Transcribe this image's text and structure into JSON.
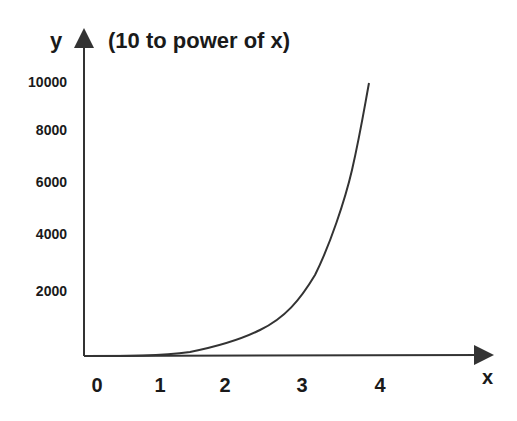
{
  "chart_data": {
    "type": "line",
    "title": "(10 to power of x)",
    "xlabel": "x",
    "ylabel": "y",
    "x_ticks": [
      "0",
      "1",
      "2",
      "3",
      "4"
    ],
    "y_ticks": [
      "2000",
      "4000",
      "6000",
      "8000",
      "10000"
    ],
    "xlim": [
      0,
      4
    ],
    "ylim": [
      0,
      10000
    ],
    "grid": false,
    "legend": null,
    "series": [
      {
        "name": "10^x",
        "x": [
          0,
          0.5,
          1,
          1.5,
          2,
          2.5,
          3,
          3.25,
          3.5,
          3.75,
          3.9
        ],
        "y": [
          0,
          5,
          10,
          60,
          300,
          800,
          1900,
          3200,
          5200,
          7600,
          10000
        ]
      }
    ],
    "colors": {
      "line": "#333333",
      "axis": "#333333",
      "text": "#1a1a1a",
      "background": "#ffffff"
    }
  },
  "labels": {
    "title": "(10 to power of x)",
    "y_axis": "y",
    "x_axis": "x",
    "y_ticks": [
      {
        "text": "10000",
        "top": 74
      },
      {
        "text": "8000",
        "top": 122
      },
      {
        "text": "6000",
        "top": 174
      },
      {
        "text": "4000",
        "top": 226
      },
      {
        "text": "2000",
        "top": 283
      }
    ],
    "x_ticks": [
      {
        "text": "0",
        "left": 97
      },
      {
        "text": "1",
        "left": 160
      },
      {
        "text": "2",
        "left": 225
      },
      {
        "text": "3",
        "left": 302
      },
      {
        "text": "4",
        "left": 380
      }
    ]
  }
}
